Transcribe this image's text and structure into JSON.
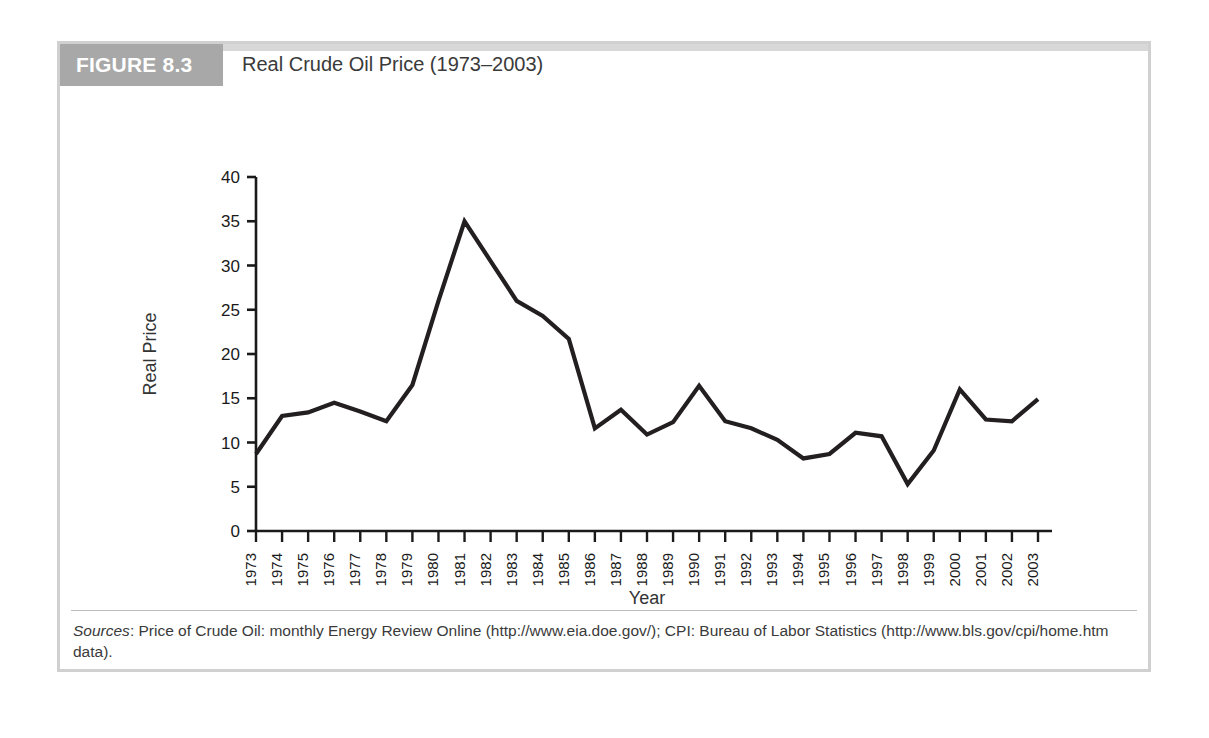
{
  "figure": {
    "number_label": "FIGURE 8.3",
    "title": "Real Crude Oil Price (1973–2003)",
    "source_label": "Sources",
    "source_text": ": Price of Crude Oil: monthly Energy Review Online (http://www.eia.doe.gov/); CPI: Bureau of Labor Statistics (http://www.bls.gov/cpi/home.htm data)."
  },
  "colors": {
    "band_gray": "#a8a8a8",
    "frame_gray": "#d0d0d0",
    "line_black": "#231f20",
    "title_gray": "#3a3a3a"
  },
  "chart_data": {
    "type": "line",
    "title": "Real Crude Oil Price (1973–2003)",
    "xlabel": "Year",
    "ylabel": "Real Price",
    "xlim": [
      1973,
      2003
    ],
    "ylim": [
      0,
      40
    ],
    "ytick_labels": [
      "0",
      "5",
      "10",
      "15",
      "20",
      "25",
      "30",
      "35",
      "40"
    ],
    "ytick_values": [
      0,
      5,
      10,
      15,
      20,
      25,
      30,
      35,
      40
    ],
    "grid": false,
    "legend": null,
    "categories": [
      "1973",
      "1974",
      "1975",
      "1976",
      "1977",
      "1978",
      "1979",
      "1980",
      "1981",
      "1982",
      "1983",
      "1984",
      "1985",
      "1986",
      "1987",
      "1988",
      "1989",
      "1990",
      "1991",
      "1992",
      "1993",
      "1994",
      "1995",
      "1996",
      "1997",
      "1998",
      "1999",
      "2000",
      "2001",
      "2002",
      "2003"
    ],
    "values": [
      8.7,
      13.0,
      13.4,
      14.5,
      13.5,
      12.4,
      16.5,
      26.0,
      35.0,
      30.5,
      26.0,
      24.3,
      21.7,
      11.6,
      13.7,
      10.9,
      12.3,
      16.4,
      12.4,
      11.6,
      10.3,
      8.2,
      8.7,
      11.1,
      10.7,
      5.3,
      9.1,
      16.0,
      12.6,
      12.4,
      14.9
    ]
  }
}
